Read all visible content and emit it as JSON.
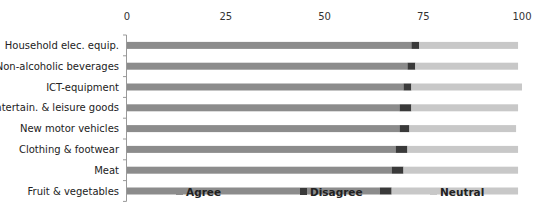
{
  "chart_data": {
    "type": "bar",
    "orientation": "horizontal",
    "stacked": true,
    "title": "",
    "xlabel": "",
    "ylabel": "",
    "xlim": [
      0,
      100
    ],
    "x_ticks": [
      "0",
      "25",
      "50",
      "75",
      "100"
    ],
    "x_axis_position": "top",
    "grid": false,
    "legend_position": "bottom",
    "categories": [
      "Household elec. equip.",
      "Non-alcoholic beverages",
      "ICT-equipment",
      "Entertain. & leisure goods",
      "New motor vehicles",
      "Clothing & footwear",
      "Meat",
      "Fruit & vegetables"
    ],
    "series": [
      {
        "name": "Agree",
        "color": "#8c8c8c",
        "values": [
          72,
          71,
          70,
          69,
          69,
          68,
          67,
          64
        ]
      },
      {
        "name": "Disagree",
        "color": "#3a3a3a",
        "values": [
          2,
          2,
          2,
          3,
          2.5,
          3,
          3,
          3
        ]
      },
      {
        "name": "Neutral",
        "color": "#c8c8c8",
        "values": [
          25,
          26,
          28,
          27,
          27,
          28,
          29,
          32
        ]
      }
    ]
  }
}
